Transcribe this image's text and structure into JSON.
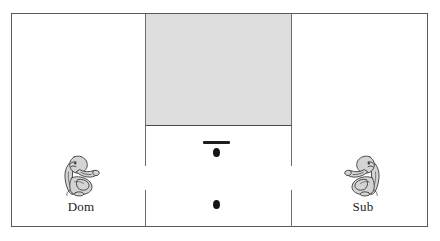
{
  "figure": {
    "name": "dyadic-foraging-arena-diagram",
    "background_color": "#ffffff"
  },
  "arena": {
    "border_color": "#5a5a5a",
    "fill_color": "#ffffff"
  },
  "chamber": {
    "name": "shaded-upper-chamber",
    "fill_color": "#dedede",
    "border_color": "#6b6b6b"
  },
  "partitions": {
    "wall_color": "#6e6e6e",
    "segments": [
      {
        "id": "left-upper"
      },
      {
        "id": "left-lower"
      },
      {
        "id": "right-upper"
      },
      {
        "id": "right-lower"
      }
    ]
  },
  "apparatus": {
    "lever_color": "#1f1f1f",
    "reward_color": "#141414",
    "rewards": [
      {
        "id": "upper-reward-dot"
      },
      {
        "id": "lower-reward-dot"
      }
    ]
  },
  "actors": [
    {
      "id": "dominant",
      "label": "Dom",
      "icon": "monkey-sitting-icon",
      "side": "left",
      "fill_color": "#d4d4d4",
      "outline_color": "#3a3a3a"
    },
    {
      "id": "subordinate",
      "label": "Sub",
      "icon": "monkey-sitting-icon",
      "side": "right",
      "fill_color": "#d4d4d4",
      "outline_color": "#3a3a3a"
    }
  ]
}
